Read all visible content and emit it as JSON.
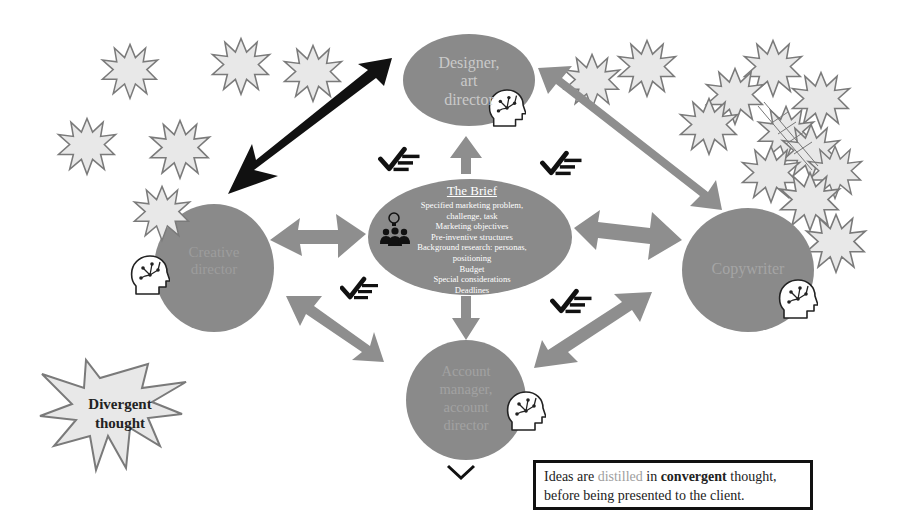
{
  "diagram": {
    "colors": {
      "node_fill": "#8a8a8a",
      "node_label": "#b9b9b9",
      "arrow_gray": "#8e8e8e",
      "arrow_black": "#111111",
      "star_fill": "#e8e8e8",
      "star_stroke": "#7a7a7a"
    },
    "nodes": {
      "designer": {
        "lines": [
          "Designer,",
          "art",
          "director"
        ]
      },
      "creative": {
        "lines": [
          "Creative",
          "director"
        ]
      },
      "copywriter": {
        "lines": [
          "Copywriter"
        ]
      },
      "account": {
        "lines": [
          "Account",
          "manager,",
          "account",
          "director"
        ]
      }
    },
    "brief": {
      "title": "The Brief",
      "items": [
        "Specified marketing problem,",
        "challenge, task",
        "Marketing objectives",
        "Pre-inventive structures",
        "Background research: personas,",
        "positioning",
        "Budget",
        "Special considerations",
        "Deadlines"
      ]
    },
    "divergent": {
      "line1": "Divergent",
      "line2": "thought"
    },
    "callout": {
      "part1": "Ideas are ",
      "part2_dim": "distilled",
      "part3": " in ",
      "part4_bold": "convergent",
      "part5": " thought,",
      "line2": "before being presented to the client."
    },
    "icons": {
      "head": "head-circuit-icon",
      "team": "team-idea-icon",
      "checklist": "check-list-icon",
      "chevron": "chevron-down-icon",
      "star": "starburst-icon"
    }
  }
}
